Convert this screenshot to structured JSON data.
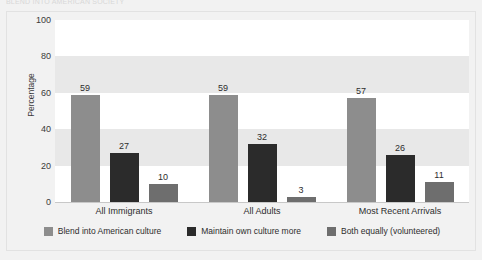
{
  "top_caption": "BLEND INTO AMERICAN SOCIETY",
  "chart_data": {
    "type": "bar",
    "title": "",
    "subtitle": "",
    "xlabel": "",
    "ylabel": "Percentage",
    "ylim": [
      0,
      100
    ],
    "yticks": [
      0,
      20,
      40,
      60,
      80,
      100
    ],
    "grid": false,
    "banded_background": true,
    "legend_position": "bottom",
    "categories": [
      "All Immigrants",
      "All Adults",
      "Most Recent Arrivals"
    ],
    "series": [
      {
        "name": "Blend into American culture",
        "color": "#8d8d8d",
        "values": [
          59,
          59,
          57
        ]
      },
      {
        "name": "Maintain own culture more",
        "color": "#2b2b2b",
        "values": [
          27,
          32,
          26
        ]
      },
      {
        "name": "Both equally (volunteered)",
        "color": "#6e6e6e",
        "values": [
          10,
          3,
          11
        ]
      }
    ]
  },
  "colors": {
    "page_background": "#f2f2f2",
    "plot_background": "#ffffff",
    "band": "#e8e8e8",
    "frame_border": "#e2e2e2",
    "axis_line": "#c8c8c8",
    "text": "#2d2d2d"
  }
}
